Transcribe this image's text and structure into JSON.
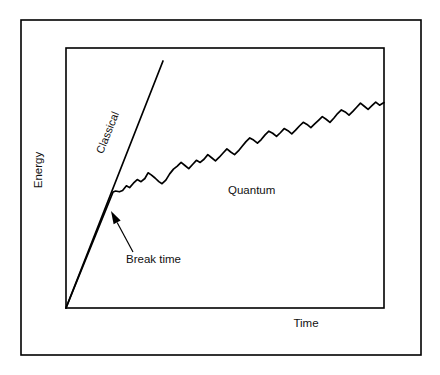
{
  "figure": {
    "kind": "line-chart",
    "background_color": "#ffffff",
    "ink_color": "#000000",
    "outer_border": {
      "x": 21,
      "y": 20,
      "width": 400,
      "height": 335,
      "stroke_width": 1.6
    },
    "plot_frame": {
      "x": 66,
      "y": 48,
      "width": 318,
      "height": 260,
      "stroke_width": 1.6
    }
  },
  "axes": {
    "ylabel": "Energy",
    "xlabel": "Time",
    "ylabel_pos": {
      "x": 42,
      "y": 170
    },
    "xlabel_pos": {
      "x": 306,
      "y": 327
    },
    "ticks": "none",
    "grid": "off"
  },
  "annotations": {
    "classical_label": "Classical",
    "classical_label_pos": {
      "x": 111,
      "y": 134
    },
    "classical_label_rotation": -68,
    "quantum_label": "Quantum",
    "quantum_label_pos": {
      "x": 228,
      "y": 194
    },
    "break_label": "Break time",
    "break_label_pos": {
      "x": 126,
      "y": 263
    },
    "break_arrow_tail": {
      "x": 133,
      "y": 252
    },
    "break_arrow_head": {
      "x": 111,
      "y": 211
    }
  },
  "chart_data": {
    "type": "line",
    "title": "",
    "xlabel": "Time",
    "ylabel": "Energy",
    "xlim": [
      0,
      1
    ],
    "ylim": [
      0,
      1
    ],
    "grid": false,
    "legend": "inline-labels",
    "tick_labels": {
      "x": [],
      "y": []
    },
    "series": [
      {
        "name": "Classical",
        "style": "straight-line",
        "x": [
          0.0,
          0.305
        ],
        "y": [
          0.0,
          0.95
        ]
      },
      {
        "name": "Quantum",
        "style": "noisy-saturating",
        "x": [
          0.0,
          0.148,
          0.156,
          0.168,
          0.178,
          0.19,
          0.2,
          0.212,
          0.224,
          0.236,
          0.248,
          0.258,
          0.268,
          0.28,
          0.292,
          0.302,
          0.314,
          0.326,
          0.338,
          0.35,
          0.362,
          0.374,
          0.386,
          0.398,
          0.41,
          0.422,
          0.434,
          0.446,
          0.458,
          0.47,
          0.482,
          0.494,
          0.506,
          0.518,
          0.53,
          0.542,
          0.554,
          0.566,
          0.578,
          0.59,
          0.602,
          0.614,
          0.626,
          0.638,
          0.65,
          0.662,
          0.674,
          0.686,
          0.698,
          0.71,
          0.722,
          0.734,
          0.746,
          0.758,
          0.77,
          0.782,
          0.794,
          0.806,
          0.818,
          0.83,
          0.842,
          0.854,
          0.866,
          0.878,
          0.89,
          0.902,
          0.914,
          0.926,
          0.938,
          0.95,
          0.962,
          0.974,
          0.986,
          1.0
        ],
        "y": [
          0.0,
          0.446,
          0.45,
          0.447,
          0.452,
          0.47,
          0.463,
          0.48,
          0.494,
          0.486,
          0.498,
          0.52,
          0.512,
          0.5,
          0.486,
          0.478,
          0.492,
          0.516,
          0.534,
          0.546,
          0.56,
          0.548,
          0.536,
          0.552,
          0.568,
          0.56,
          0.572,
          0.59,
          0.578,
          0.566,
          0.58,
          0.596,
          0.612,
          0.6,
          0.59,
          0.604,
          0.622,
          0.64,
          0.654,
          0.646,
          0.634,
          0.648,
          0.666,
          0.68,
          0.672,
          0.66,
          0.674,
          0.69,
          0.682,
          0.67,
          0.684,
          0.7,
          0.714,
          0.706,
          0.694,
          0.708,
          0.722,
          0.736,
          0.726,
          0.714,
          0.73,
          0.748,
          0.762,
          0.754,
          0.742,
          0.756,
          0.772,
          0.788,
          0.776,
          0.764,
          0.778,
          0.792,
          0.78,
          0.79
        ],
        "break_point": {
          "x": 0.148,
          "y": 0.446
        }
      }
    ]
  }
}
